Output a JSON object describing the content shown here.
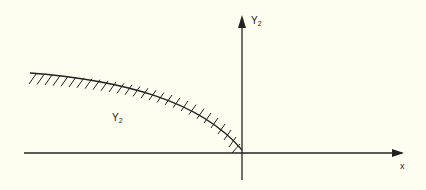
{
  "diagram": {
    "background": "#fdfdf0",
    "stroke_color": "#222222",
    "y_axis_label": {
      "main": "Y",
      "sub": "2"
    },
    "x_axis_label": "x",
    "region_label": {
      "main": "Y",
      "sub": "2"
    },
    "region_description": "Hatched boundary curve in second quadrant from upper-left descending to origin"
  }
}
